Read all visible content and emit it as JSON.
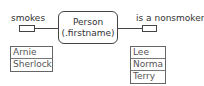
{
  "diagram": {
    "entity": {
      "name": "Person",
      "attribute": "(.firstname)"
    },
    "left_relation": {
      "label": "smokes",
      "members": [
        "Arnie",
        "Sherlock"
      ]
    },
    "right_relation": {
      "label": "is a nonsmoker",
      "members": [
        "Lee",
        "Norma",
        "Terry"
      ]
    }
  }
}
